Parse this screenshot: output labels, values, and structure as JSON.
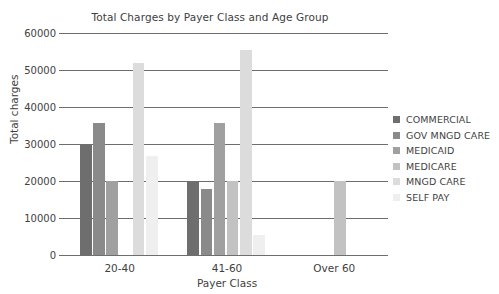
{
  "chart_data": {
    "type": "bar",
    "title": "Total Charges by Payer Class and Age Group",
    "xlabel": "Payer Class",
    "ylabel": "Total charges",
    "categories": [
      "20-40",
      "41-60",
      "Over 60"
    ],
    "ylim": [
      0,
      60000
    ],
    "yticks": [
      0,
      10000,
      20000,
      30000,
      40000,
      50000,
      60000
    ],
    "ytick_labels": [
      "0",
      "10000",
      "20000",
      "30000",
      "40000",
      "50000",
      "60000"
    ],
    "grid": true,
    "legend_position": "right",
    "series": [
      {
        "name": "COMMERCIAL",
        "color": "#6e6e6e",
        "values": [
          30000,
          20000,
          null
        ]
      },
      {
        "name": "GOV MNGD CARE",
        "color": "#8a8a8a",
        "values": [
          35800,
          17800,
          null
        ]
      },
      {
        "name": "MEDICAID",
        "color": "#a0a0a0",
        "values": [
          20000,
          35800,
          null
        ]
      },
      {
        "name": "MEDICARE",
        "color": "#c2c2c2",
        "values": [
          null,
          20000,
          20000
        ]
      },
      {
        "name": "MNGD CARE",
        "color": "#dcdcdc",
        "values": [
          52000,
          55500,
          null
        ]
      },
      {
        "name": "SELF PAY",
        "color": "#efefef",
        "values": [
          26700,
          5500,
          null
        ]
      }
    ]
  },
  "legend": {
    "items": [
      {
        "label": "COMMERCIAL",
        "color": "#6e6e6e"
      },
      {
        "label": "GOV MNGD CARE",
        "color": "#8a8a8a"
      },
      {
        "label": "MEDICAID",
        "color": "#a0a0a0"
      },
      {
        "label": "MEDICARE",
        "color": "#c2c2c2"
      },
      {
        "label": "MNGD CARE",
        "color": "#dcdcdc"
      },
      {
        "label": "SELF PAY",
        "color": "#efefef"
      }
    ]
  }
}
